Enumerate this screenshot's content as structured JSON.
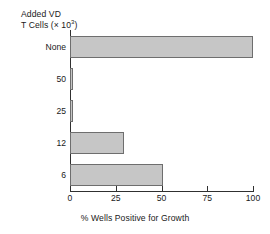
{
  "chart_data": {
    "type": "bar",
    "orientation": "horizontal",
    "title": "",
    "categories": [
      "None",
      "50",
      "25",
      "12",
      "6"
    ],
    "values": [
      100,
      1,
      1,
      29.5,
      51
    ],
    "ylabel": "Added VD T Cells (× 10³)",
    "ylabel_line1": "Added VD",
    "ylabel_line2_pre": "T Cells (× 10",
    "ylabel_line2_sup": "3",
    "ylabel_line2_post": ")",
    "xlabel": "% Wells Positive for Growth",
    "xlim": [
      0,
      100
    ],
    "xticks": [
      0,
      25,
      50,
      75,
      100
    ],
    "xticklabels": [
      "0",
      "25",
      "50",
      "75",
      "100"
    ],
    "grid": false,
    "legend": false,
    "bar_fill_color": "#c6c6c6",
    "bar_edge_color": "#6e6e6e",
    "axis_color": "#303030"
  }
}
